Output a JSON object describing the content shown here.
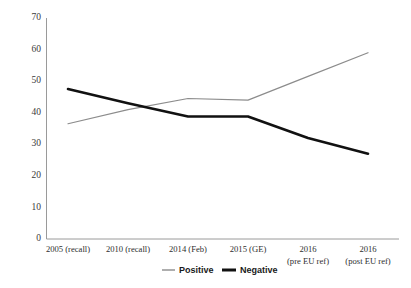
{
  "chart_data": {
    "type": "line",
    "title": "",
    "subtitle": "",
    "xlabel": "",
    "ylabel": "",
    "ylim": [
      0,
      70
    ],
    "yticks": [
      0,
      10,
      20,
      30,
      40,
      50,
      60,
      70
    ],
    "grid": false,
    "legend_position": "bottom",
    "categories": [
      "2005 (recall)",
      "2010 (recall)",
      "2014 (Feb)",
      "2015 (GE)",
      "2016\n(pre EU ref)",
      "2016\n(post EU ref)"
    ],
    "category_lines": [
      [
        "2005 (recall)",
        ""
      ],
      [
        "2010 (recall)",
        ""
      ],
      [
        "2014 (Feb)",
        ""
      ],
      [
        "2015 (GE)",
        ""
      ],
      [
        "2016",
        "(pre EU ref)"
      ],
      [
        "2016",
        "(post EU ref)"
      ]
    ],
    "series": [
      {
        "name": "Positive",
        "color": "#8c8c8c",
        "values": [
          36.5,
          41.0,
          44.5,
          44.0,
          51.5,
          59.0
        ]
      },
      {
        "name": "Negative",
        "color": "#111111",
        "values": [
          47.5,
          43.0,
          38.8,
          38.8,
          32.0,
          27.0
        ]
      }
    ]
  },
  "legend": {
    "entries": [
      {
        "label": "Positive",
        "color": "#8c8c8c"
      },
      {
        "label": "Negative",
        "color": "#111111"
      }
    ]
  },
  "axis": {
    "y_tick_labels": [
      "70",
      "60",
      "50",
      "40",
      "30",
      "20",
      "10",
      "0"
    ]
  }
}
